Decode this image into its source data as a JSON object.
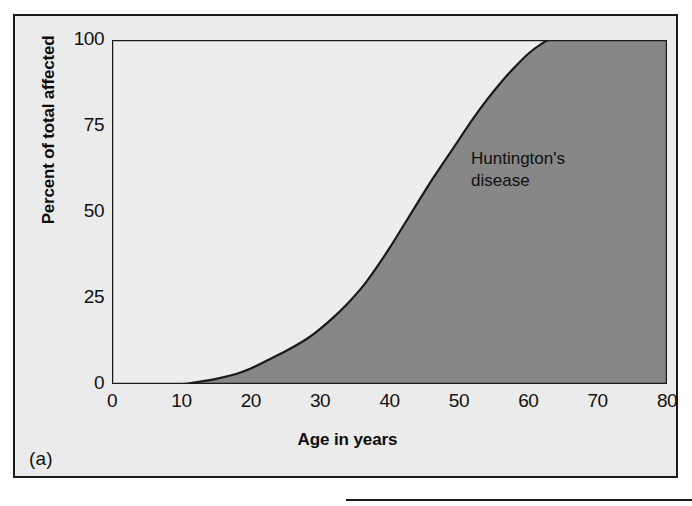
{
  "figure": {
    "panel_label": "(a)",
    "background_color": "#ebebeb",
    "border_color": "#1a1a1a"
  },
  "chart_data": {
    "type": "area",
    "title": "",
    "subtitle": "",
    "xlabel": "Age in years",
    "ylabel": "Percent of total affected",
    "xlim": [
      0,
      80
    ],
    "ylim": [
      0,
      100
    ],
    "xticks": [
      0,
      10,
      20,
      30,
      40,
      50,
      60,
      70,
      80
    ],
    "yticks": [
      0,
      25,
      50,
      75,
      100
    ],
    "xtick_labels": [
      "0",
      "10",
      "20",
      "30",
      "40",
      "50",
      "60",
      "70",
      "80"
    ],
    "ytick_labels": [
      "0",
      "25",
      "50",
      "75",
      "100"
    ],
    "grid": false,
    "legend_position": "none",
    "annotations": [
      {
        "text": "Huntington's\ndisease",
        "x": 57,
        "y": 72
      }
    ],
    "series": [
      {
        "name": "Huntington's disease",
        "fill_color": "#878787",
        "above_fill_color": "#ededed",
        "line_color": "#1a1a1a",
        "x": [
          0,
          5,
          10,
          12,
          15,
          18,
          20,
          22,
          25,
          28,
          30,
          32,
          34,
          36,
          38,
          40,
          42,
          44,
          46,
          48,
          50,
          52,
          54,
          56,
          58,
          60,
          62,
          63,
          65,
          70,
          75,
          80
        ],
        "values": [
          0,
          0,
          0,
          0.5,
          1.5,
          3,
          4.5,
          6.5,
          9.5,
          13,
          16,
          19.5,
          23.5,
          28,
          33.5,
          39.5,
          46,
          52.5,
          59,
          65,
          71,
          77,
          82.5,
          87.5,
          92,
          96,
          99,
          100,
          100,
          100,
          100,
          100
        ]
      }
    ]
  },
  "next_panel": {
    "rule_color": "#1a1a1a"
  }
}
